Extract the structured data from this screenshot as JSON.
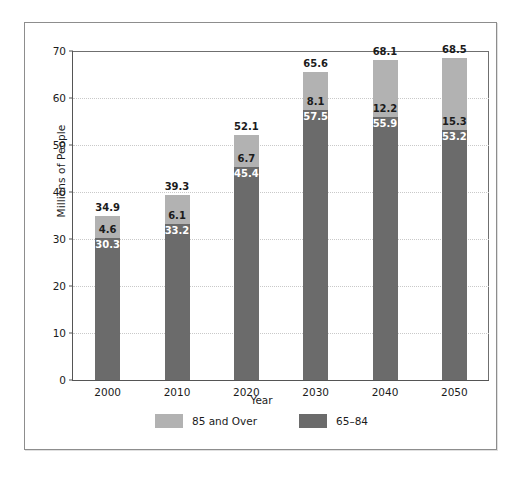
{
  "chart_data": {
    "type": "bar",
    "subtype": "stacked",
    "title": "",
    "xlabel": "Year",
    "ylabel": "Millions of People",
    "categories": [
      "2000",
      "2010",
      "2020",
      "2030",
      "2040",
      "2050"
    ],
    "ylim": [
      0,
      70
    ],
    "yticks": [
      0,
      10,
      20,
      30,
      40,
      50,
      60,
      70
    ],
    "ytick_labels": [
      "0",
      "10",
      "20",
      "30",
      "40",
      "50",
      "60",
      "70"
    ],
    "grid": "horizontal-dotted",
    "legend_position": "bottom-center",
    "series": [
      {
        "name": "65–84",
        "color": "#6b6b6b",
        "values": [
          30.3,
          33.2,
          45.4,
          57.5,
          55.9,
          53.2
        ],
        "labels": [
          "30.3",
          "33.2",
          "45.4",
          "57.5",
          "55.9",
          "53.2"
        ]
      },
      {
        "name": "85 and Over",
        "color": "#b2b2b2",
        "values": [
          4.6,
          6.1,
          6.7,
          8.1,
          12.2,
          15.3
        ],
        "labels": [
          "4.6",
          "6.1",
          "6.7",
          "8.1",
          "12.2",
          "15.3"
        ]
      }
    ],
    "totals": [
      34.9,
      39.3,
      52.1,
      65.6,
      68.1,
      68.5
    ],
    "total_labels": [
      "34.9",
      "39.3",
      "52.1",
      "65.6",
      "68.1",
      "68.5"
    ]
  },
  "axes": {
    "y_title": "Millions of People",
    "x_title": "Year"
  },
  "legend": {
    "items": [
      {
        "label": "85 and Over",
        "swatch": "light"
      },
      {
        "label": "65–84",
        "swatch": "dark"
      }
    ]
  }
}
